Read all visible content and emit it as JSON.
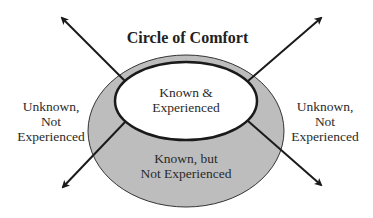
{
  "diagram": {
    "title": "Circle of Comfort",
    "inner_region": {
      "lines": [
        "Known &",
        "Experienced"
      ]
    },
    "middle_region": {
      "lines": [
        "Known, but",
        "Not Experienced"
      ]
    },
    "left_region": {
      "lines": [
        "Unknown,",
        "Not",
        "Experienced"
      ]
    },
    "right_region": {
      "lines": [
        "Unknown,",
        "Not",
        "Experienced"
      ]
    },
    "colors": {
      "outer_ring_fill": "#bdbdbd",
      "inner_fill": "#ffffff",
      "stroke": "#1a1a1a"
    },
    "arrows": [
      "top-left",
      "top-right",
      "bottom-left",
      "bottom-right"
    ]
  }
}
